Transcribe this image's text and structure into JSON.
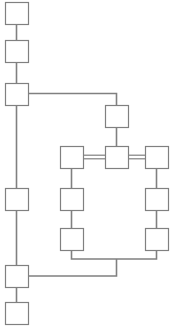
{
  "diagram": {
    "canvas": {
      "width": 174,
      "height": 334
    },
    "style": {
      "node_fill": "#ffffff",
      "node_stroke": "#808080",
      "edge_stroke": "#808080",
      "background": "#ffffff",
      "node_size": 23
    },
    "nodes": [
      {
        "id": "n1",
        "name": "node-top-1",
        "label": "",
        "x": 5,
        "y": 2,
        "w": 23,
        "h": 22
      },
      {
        "id": "n2",
        "name": "node-top-2",
        "label": "",
        "x": 5,
        "y": 40,
        "w": 23,
        "h": 22
      },
      {
        "id": "n3",
        "name": "node-branch-left",
        "label": "",
        "x": 5,
        "y": 83,
        "w": 23,
        "h": 22
      },
      {
        "id": "n4",
        "name": "node-left-mid",
        "label": "",
        "x": 5,
        "y": 188,
        "w": 23,
        "h": 22
      },
      {
        "id": "n5",
        "name": "node-left-join",
        "label": "",
        "x": 5,
        "y": 265,
        "w": 23,
        "h": 22
      },
      {
        "id": "n6",
        "name": "node-bottom-last",
        "label": "",
        "x": 5,
        "y": 302,
        "w": 23,
        "h": 22
      },
      {
        "id": "n7",
        "name": "node-upper-center",
        "label": "",
        "x": 105,
        "y": 105,
        "w": 23,
        "h": 22
      },
      {
        "id": "n8",
        "name": "node-hub-center",
        "label": "",
        "x": 105,
        "y": 146,
        "w": 23,
        "h": 22
      },
      {
        "id": "n9",
        "name": "node-hub-left",
        "label": "",
        "x": 60,
        "y": 146,
        "w": 23,
        "h": 22
      },
      {
        "id": "n10",
        "name": "node-hub-right",
        "label": "",
        "x": 145,
        "y": 146,
        "w": 23,
        "h": 22
      },
      {
        "id": "n11",
        "name": "node-innercol-upper",
        "label": "",
        "x": 60,
        "y": 188,
        "w": 23,
        "h": 22
      },
      {
        "id": "n12",
        "name": "node-innercol-lower",
        "label": "",
        "x": 60,
        "y": 228,
        "w": 23,
        "h": 22
      },
      {
        "id": "n13",
        "name": "node-rightcol-upper",
        "label": "",
        "x": 145,
        "y": 188,
        "w": 23,
        "h": 22
      },
      {
        "id": "n14",
        "name": "node-rightcol-lower",
        "label": "",
        "x": 145,
        "y": 228,
        "w": 23,
        "h": 22
      }
    ],
    "edges": [
      {
        "id": "e1",
        "name": "edge-n1-n2",
        "type": "single",
        "points": "16.5,24 16.5,40"
      },
      {
        "id": "e2",
        "name": "edge-n2-n3",
        "type": "single",
        "points": "16.5,62 16.5,83"
      },
      {
        "id": "e3",
        "name": "edge-n3-n4",
        "type": "single",
        "points": "16.5,105 16.5,188"
      },
      {
        "id": "e4",
        "name": "edge-n4-n5",
        "type": "single",
        "points": "16.5,210 16.5,265"
      },
      {
        "id": "e5",
        "name": "edge-n5-n6",
        "type": "single",
        "points": "16.5,287 16.5,302"
      },
      {
        "id": "e6",
        "name": "edge-n3-n7-elbow",
        "type": "single",
        "points": "28,93.5 116.5,93.5 116.5,105"
      },
      {
        "id": "e7",
        "name": "edge-n7-n8",
        "type": "single",
        "points": "116.5,127 116.5,146"
      },
      {
        "id": "e8",
        "name": "edge-n9-n8-double",
        "type": "double",
        "points": "83,157 105,157"
      },
      {
        "id": "e9",
        "name": "edge-n8-n10-double",
        "type": "double",
        "points": "128,157 145,157"
      },
      {
        "id": "e10",
        "name": "edge-n9-n11",
        "type": "single",
        "points": "71.5,168 71.5,188"
      },
      {
        "id": "e11",
        "name": "edge-n11-n12",
        "type": "single",
        "points": "71.5,210 71.5,228"
      },
      {
        "id": "e12",
        "name": "edge-n10-n13",
        "type": "single",
        "points": "156.5,168 156.5,188"
      },
      {
        "id": "e13",
        "name": "edge-n13-n14",
        "type": "single",
        "points": "156.5,210 156.5,228"
      },
      {
        "id": "e14",
        "name": "edge-n12-bottom-bus",
        "type": "single",
        "points": "71.5,250 71.5,259 156.5,259 156.5,250"
      },
      {
        "id": "e15",
        "name": "edge-bottom-bus-n5",
        "type": "single",
        "points": "116.5,259 116.5,276 28,276"
      }
    ]
  }
}
